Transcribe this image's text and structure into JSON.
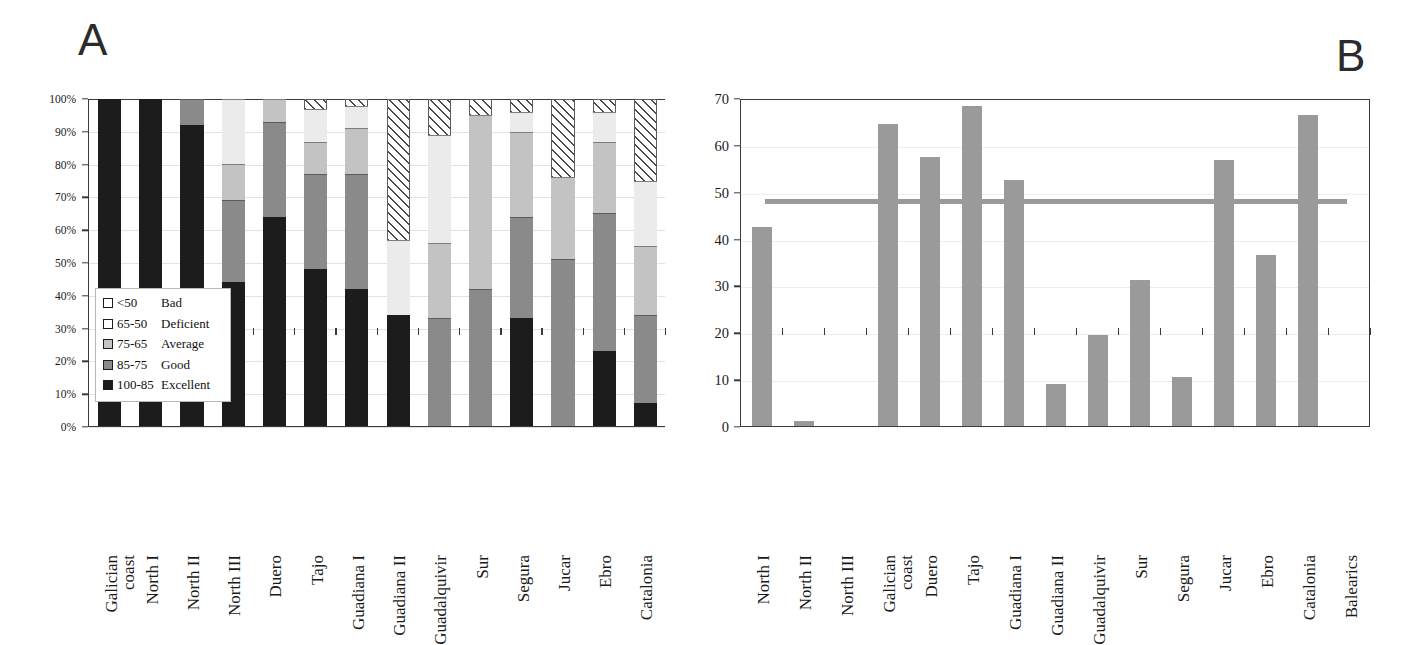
{
  "figure": {
    "panel_a_letter": "A",
    "panel_b_letter": "B"
  },
  "panel_a": {
    "y_axis": {
      "ticks": [
        "0%",
        "10%",
        "20%",
        "30%",
        "40%",
        "50%",
        "60%",
        "70%",
        "80%",
        "90%",
        "100%"
      ],
      "min": 0,
      "max": 100
    },
    "legend": {
      "items": [
        {
          "range": "<50",
          "name": "Bad",
          "key": "bad"
        },
        {
          "range": "65-50",
          "name": "Deficient",
          "key": "deficient"
        },
        {
          "range": "75-65",
          "name": "Average",
          "key": "average"
        },
        {
          "range": "85-75",
          "name": "Good",
          "key": "good"
        },
        {
          "range": "100-85",
          "name": "Excellent",
          "key": "excellent"
        }
      ]
    }
  },
  "panel_b": {
    "y_axis": {
      "ticks": [
        "0",
        "10",
        "20",
        "30",
        "40",
        "50",
        "60",
        "70"
      ],
      "min": 0,
      "max": 70
    },
    "reference_line_value": 48
  },
  "chart_data": [
    {
      "type": "bar",
      "id": "panel-a",
      "title": "A",
      "stacked": true,
      "normalized_percent": true,
      "xlabel": "",
      "ylabel": "",
      "ylim": [
        0,
        100
      ],
      "ytick_labels": [
        "0%",
        "10%",
        "20%",
        "30%",
        "40%",
        "50%",
        "60%",
        "70%",
        "80%",
        "90%",
        "100%"
      ],
      "grid": true,
      "legend_position": "inside-lower-left",
      "categories": [
        "Galician coast",
        "North I",
        "North II",
        "North III",
        "Duero",
        "Tajo",
        "Guadiana I",
        "Guadiana II",
        "Guadalquivir",
        "Sur",
        "Segura",
        "Jucar",
        "Ebro",
        "Catalonia"
      ],
      "series": [
        {
          "name": "100-85 Excellent",
          "color": "#1c1c1c",
          "values": [
            100,
            100,
            92,
            44,
            64,
            48,
            42,
            34,
            0,
            0,
            33,
            0,
            23,
            7
          ]
        },
        {
          "name": "85-75 Good",
          "color": "#8a8a8a",
          "values": [
            0,
            0,
            8,
            25,
            29,
            29,
            35,
            0,
            33,
            42,
            31,
            51,
            42,
            27
          ]
        },
        {
          "name": "75-65 Average",
          "color": "#c3c3c3",
          "values": [
            0,
            0,
            0,
            11,
            7,
            10,
            14,
            0,
            23,
            53,
            26,
            25,
            22,
            21
          ]
        },
        {
          "name": "65-50 Deficient",
          "color": "#ebebeb",
          "values": [
            0,
            0,
            0,
            20,
            0,
            10,
            7,
            23,
            33,
            0,
            6,
            0,
            9,
            20
          ]
        },
        {
          "name": "<50 Bad",
          "color": "hatched",
          "values": [
            0,
            0,
            0,
            0,
            0,
            3,
            2,
            43,
            11,
            5,
            4,
            24,
            4,
            25
          ]
        }
      ]
    },
    {
      "type": "bar",
      "id": "panel-b",
      "title": "B",
      "stacked": false,
      "xlabel": "",
      "ylabel": "",
      "ylim": [
        0,
        70
      ],
      "ytick_labels": [
        "0",
        "10",
        "20",
        "30",
        "40",
        "50",
        "60",
        "70"
      ],
      "grid": true,
      "bar_color": "#9a9a9a",
      "annotations": [
        {
          "type": "hline",
          "value": 48,
          "color": "#9a9a9a",
          "label": ""
        }
      ],
      "categories": [
        "North I",
        "North II",
        "North III",
        "Galician coast",
        "Duero",
        "Tajo",
        "Guadiana I",
        "Guadiana II",
        "Guadalquivir",
        "Sur",
        "Segura",
        "Jucar",
        "Ebro",
        "Catalonia",
        "Balearics"
      ],
      "values": [
        42.5,
        1.0,
        0,
        64.5,
        57.5,
        68.2,
        52.5,
        9.0,
        19.4,
        31.2,
        10.5,
        56.7,
        36.6,
        66.3,
        0
      ]
    }
  ]
}
